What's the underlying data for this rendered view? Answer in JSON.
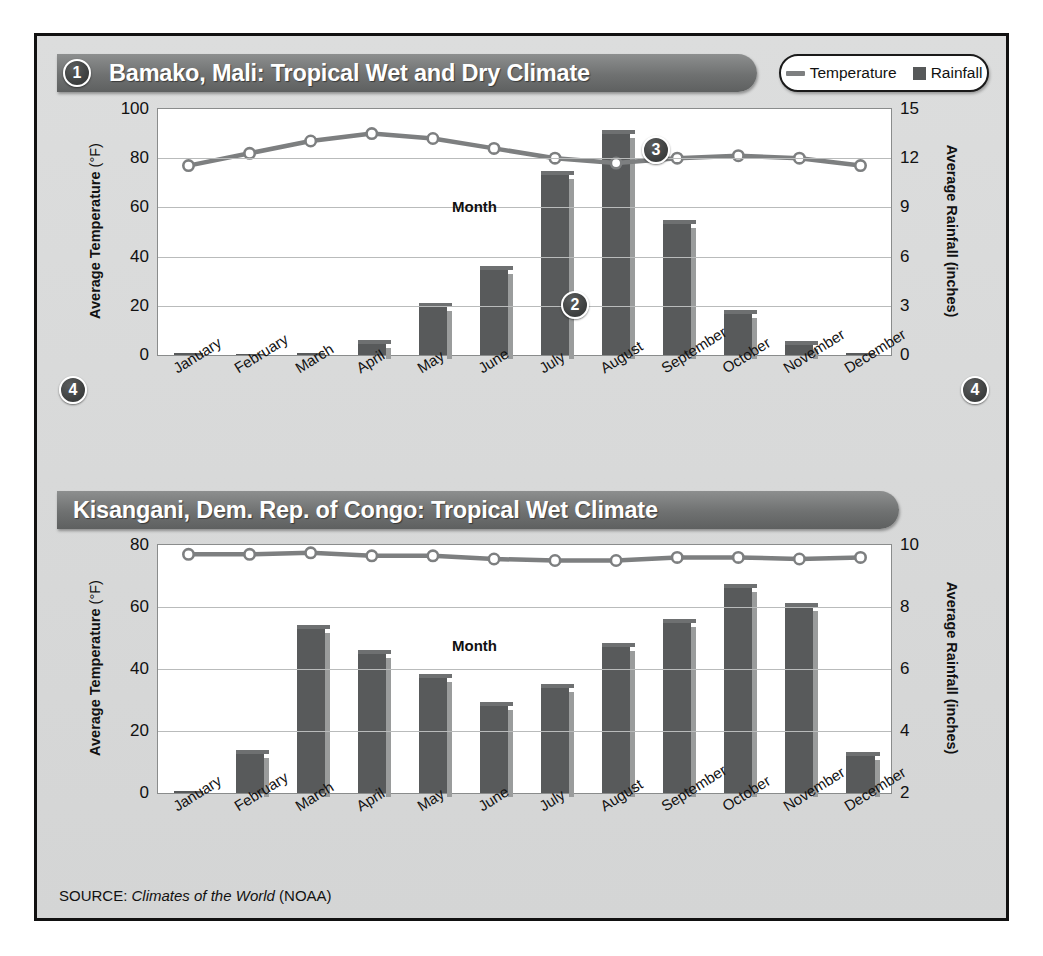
{
  "figure": {
    "source_prefix": "SOURCE: ",
    "source_title": "Climates of the World",
    "source_suffix": " (NOAA)"
  },
  "legend": {
    "temperature_label": "Temperature",
    "rainfall_label": "Rainfall",
    "line_color": "#7d7f80",
    "bar_color": "#565859"
  },
  "badges": {
    "one": "1",
    "two": "2",
    "three": "3",
    "four_left": "4",
    "four_right": "4"
  },
  "axis_titles": {
    "temperature": "Average Temperature",
    "temperature_unit": "(°F)",
    "rainfall": "Average Rainfall",
    "rainfall_unit": "(inches)",
    "month": "Month"
  },
  "chart_data": [
    {
      "type": "bar",
      "id": "bamako",
      "title": "Bamako, Mali: Tropical Wet and Dry Climate",
      "xlabel": "Month",
      "ylabel": "Average Temperature (°F)",
      "y2label": "Average Rainfall (inches)",
      "categories": [
        "January",
        "February",
        "March",
        "April",
        "May",
        "June",
        "July",
        "August",
        "September",
        "October",
        "November",
        "December"
      ],
      "ylim": [
        0,
        100
      ],
      "yticks": [
        0,
        20,
        40,
        60,
        80,
        100
      ],
      "y2lim": [
        0,
        15
      ],
      "y2ticks": [
        0,
        3,
        6,
        9,
        12,
        15
      ],
      "grid": true,
      "legend_position": "top-right",
      "series": [
        {
          "name": "Rainfall",
          "axis": "y2",
          "type": "bar",
          "values": [
            0.1,
            0.05,
            0.15,
            0.7,
            2.9,
            5.2,
            11.0,
            13.5,
            8.0,
            2.5,
            0.6,
            0.1
          ]
        },
        {
          "name": "Temperature",
          "axis": "y",
          "type": "line",
          "values": [
            77,
            82,
            87,
            90,
            88,
            84,
            80,
            78,
            80,
            81,
            80,
            77
          ]
        }
      ],
      "annotations": [
        {
          "label": "2",
          "at": "July"
        },
        {
          "label": "3",
          "at": "August"
        }
      ]
    },
    {
      "type": "bar",
      "id": "kisangani",
      "title": "Kisangani, Dem. Rep. of Congo: Tropical Wet Climate",
      "xlabel": "Month",
      "ylabel": "Average Temperature (°F)",
      "y2label": "Average Rainfall (inches)",
      "categories": [
        "January",
        "February",
        "March",
        "April",
        "May",
        "June",
        "July",
        "August",
        "September",
        "October",
        "November",
        "December"
      ],
      "ylim": [
        0,
        80
      ],
      "yticks": [
        0,
        20,
        40,
        60,
        80
      ],
      "y2lim": [
        2,
        10
      ],
      "y2ticks": [
        2,
        4,
        6,
        8,
        10
      ],
      "grid": true,
      "legend_position": "none",
      "series": [
        {
          "name": "Rainfall",
          "axis": "y2",
          "type": "bar",
          "values": [
            2.05,
            3.25,
            7.3,
            6.5,
            5.7,
            4.8,
            5.4,
            6.7,
            7.5,
            8.6,
            8.0,
            3.2
          ]
        },
        {
          "name": "Temperature",
          "axis": "y",
          "type": "line",
          "values": [
            77,
            77,
            77.5,
            76.5,
            76.5,
            75.5,
            75,
            75,
            76,
            76,
            75.5,
            76
          ]
        }
      ],
      "annotations": []
    }
  ]
}
